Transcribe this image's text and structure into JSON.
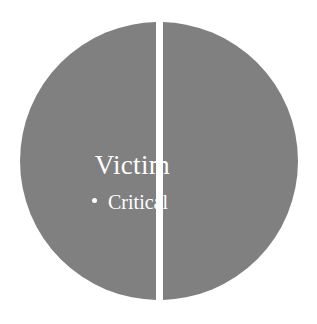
{
  "figure": {
    "background_color": "#ffffff",
    "width": 317,
    "height": 324
  },
  "diagram": {
    "type": "split-circle",
    "shape_color": "#808080",
    "divider_color": "#ffffff",
    "text_color": "#ffffff",
    "halves": [
      {
        "side": "left",
        "label": "Victim"
      },
      {
        "side": "right",
        "label": ""
      }
    ],
    "title": "Victim",
    "bullets": [
      {
        "marker": "•",
        "label": "Critical"
      }
    ]
  }
}
